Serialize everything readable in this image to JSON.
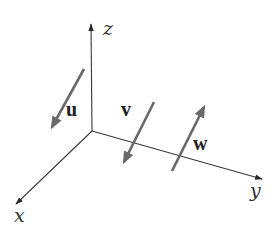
{
  "diagram": {
    "type": "3d-coordinate-axes-with-vectors",
    "axes": [
      {
        "id": "z",
        "label": "z",
        "from": [
          92,
          131
        ],
        "to": [
          91,
          24
        ],
        "label_pos": [
          103,
          35
        ]
      },
      {
        "id": "y",
        "label": "y",
        "from": [
          92,
          131
        ],
        "to": [
          262,
          179
        ],
        "label_pos": [
          250,
          197
        ]
      },
      {
        "id": "x",
        "label": "x",
        "from": [
          92,
          131
        ],
        "to": [
          16,
          204
        ],
        "label_pos": [
          14,
          222
        ]
      }
    ],
    "vectors": [
      {
        "id": "u",
        "label": "u",
        "from": [
          84,
          69
        ],
        "to": [
          52,
          127
        ],
        "label_pos": [
          66,
          116
        ]
      },
      {
        "id": "v",
        "label": "v",
        "from": [
          154,
          102
        ],
        "to": [
          124,
          162
        ],
        "label_pos": [
          121,
          116
        ]
      },
      {
        "id": "w",
        "label": "w",
        "from": [
          172,
          171
        ],
        "to": [
          204,
          107
        ],
        "label_pos": [
          193,
          150
        ]
      }
    ],
    "colors": {
      "axis": "#3a3a3a",
      "vector": "#6a6a6a",
      "label": "#222222",
      "background": "#ffffff"
    }
  }
}
